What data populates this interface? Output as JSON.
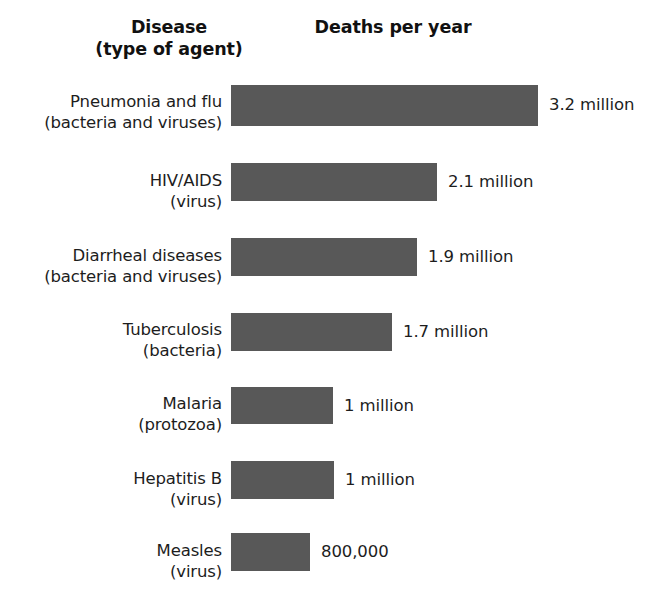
{
  "header": {
    "disease_line1": "Disease",
    "disease_line2": "(type of agent)",
    "deaths_title": "Deaths per year"
  },
  "chart_data": {
    "type": "bar",
    "title": "Deaths per year",
    "xlabel": "Deaths per year",
    "ylabel": "Disease (type of agent)",
    "orientation": "horizontal",
    "grid": false,
    "legend": "none",
    "xlim": [
      0,
      3.2
    ],
    "units": "millions of deaths per year",
    "bar_color": "#585858",
    "categories": [
      "Pneumonia and flu",
      "HIV/AIDS",
      "Diarrheal diseases",
      "Tuberculosis",
      "Malaria",
      "Hepatitis B",
      "Measles"
    ],
    "agents": [
      "(bacteria and viruses)",
      "(virus)",
      "(bacteria and viruses)",
      "(bacteria)",
      "(protozoa)",
      "(virus)",
      "(virus)"
    ],
    "values": [
      3.2,
      2.1,
      1.9,
      1.7,
      1.0,
      1.0,
      0.8
    ],
    "value_labels": [
      "3.2 million",
      "2.1 million",
      "1.9 million",
      "1.7 million",
      "1 million",
      "1 million",
      "800,000"
    ]
  },
  "rows": [
    {
      "name": "Pneumonia and flu",
      "agent": "(bacteria and viruses)",
      "value_label": "3.2 million",
      "value": 3.2,
      "bar_width": 307,
      "bar_top": 85,
      "bar_height": 41,
      "label_top": 92,
      "value_top": 95
    },
    {
      "name": "HIV/AIDS",
      "agent": "(virus)",
      "value_label": "2.1 million",
      "value": 2.1,
      "bar_width": 206,
      "bar_top": 163,
      "bar_height": 38,
      "label_top": 171,
      "value_top": 172
    },
    {
      "name": "Diarrheal diseases",
      "agent": "(bacteria and viruses)",
      "value_label": "1.9 million",
      "value": 1.9,
      "bar_width": 186,
      "bar_top": 238,
      "bar_height": 38,
      "label_top": 246,
      "value_top": 247
    },
    {
      "name": "Tuberculosis",
      "agent": "(bacteria)",
      "value_label": "1.7 million",
      "value": 1.7,
      "bar_width": 161,
      "bar_top": 313,
      "bar_height": 38,
      "label_top": 320,
      "value_top": 322
    },
    {
      "name": "Malaria",
      "agent": "(protozoa)",
      "value_label": "1 million",
      "value": 1.0,
      "bar_width": 102,
      "bar_top": 387,
      "bar_height": 37,
      "label_top": 394,
      "value_top": 396
    },
    {
      "name": "Hepatitis B",
      "agent": "(virus)",
      "value_label": "1 million",
      "value": 1.0,
      "bar_width": 103,
      "bar_top": 461,
      "bar_height": 38,
      "label_top": 469,
      "value_top": 470
    },
    {
      "name": "Measles",
      "agent": "(virus)",
      "value_label": "800,000",
      "value": 0.8,
      "bar_width": 79,
      "bar_top": 533,
      "bar_height": 38,
      "label_top": 541,
      "value_top": 542
    }
  ]
}
